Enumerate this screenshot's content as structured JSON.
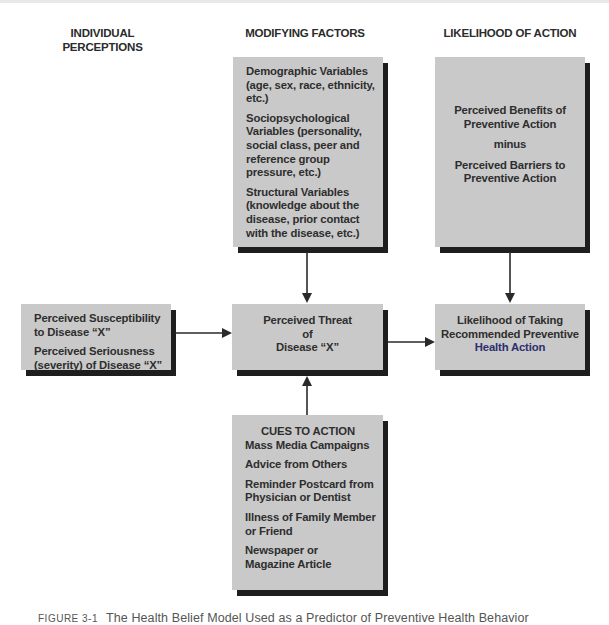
{
  "columns": {
    "individual": "INDIVIDUAL\nPERCEPTIONS",
    "individual_line1": "INDIVIDUAL",
    "individual_line2": "PERCEPTIONS",
    "modifying": "MODIFYING FACTORS",
    "likelihood": "LIKELIHOOD OF ACTION"
  },
  "boxes": {
    "modifying_factors": {
      "items": [
        {
          "title": "Demographic Variables",
          "detail": "(age, sex, race, ethnicity, etc.)"
        },
        {
          "title": "Sociopsychological Variables",
          "detail": "(personality, social class, peer and reference group pressure, etc.)"
        },
        {
          "title": "Structural Variables",
          "detail": "(knowledge about the disease, prior contact with the disease, etc.)"
        }
      ],
      "lines": [
        [
          "Demographic Variables",
          "(age, sex, race, ethnicity,",
          "etc.)"
        ],
        [
          "Sociopsychological",
          "Variables (personality,",
          "social class, peer and",
          "reference group",
          "pressure, etc.)"
        ],
        [
          "Structural Variables",
          "(knowledge about the",
          "disease, prior contact",
          "with the disease, etc.)"
        ]
      ]
    },
    "benefits_barriers": {
      "benefits": [
        "Perceived Benefits of",
        "Preventive Action"
      ],
      "operator": "minus",
      "barriers": [
        "Perceived Barriers to",
        "Preventive Action"
      ]
    },
    "individual_perceptions": {
      "susceptibility": [
        "Perceived Susceptibility",
        "to Disease “X”"
      ],
      "seriousness": [
        "Perceived Seriousness",
        "(severity) of Disease “X”"
      ]
    },
    "perceived_threat": {
      "lines": [
        "Perceived Threat",
        "of",
        "Disease “X”"
      ]
    },
    "likelihood_action": {
      "lines": [
        "Likelihood of Taking",
        "Recommended Preventive",
        "Health Action"
      ]
    },
    "cues_to_action": {
      "title": "CUES TO ACTION",
      "items": [
        [
          "Mass Media Campaigns"
        ],
        [
          "Advice from Others"
        ],
        [
          "Reminder Postcard from",
          "Physician or Dentist"
        ],
        [
          "Illness of Family Member",
          "or Friend"
        ],
        [
          "Newspaper or",
          "Magazine Article"
        ]
      ]
    }
  },
  "connections": [
    {
      "from": "Modifying Factors",
      "to": "Perceived Threat of Disease X",
      "direction": "down"
    },
    {
      "from": "Perceived Benefits minus Barriers",
      "to": "Likelihood of Taking Recommended Preventive Health Action",
      "direction": "down"
    },
    {
      "from": "Individual Perceptions",
      "to": "Perceived Threat of Disease X",
      "direction": "right"
    },
    {
      "from": "Perceived Threat of Disease X",
      "to": "Likelihood of Taking Recommended Preventive Health Action",
      "direction": "right"
    },
    {
      "from": "Cues to Action",
      "to": "Perceived Threat of Disease X",
      "direction": "up"
    }
  ],
  "caption": {
    "label": "FIGURE 3-1",
    "text": "The Health Belief Model Used as a Predictor of Preventive Health Behavior"
  },
  "colors": {
    "box_fill": "#c9c9c9",
    "box_shadow": "#1e1e1e",
    "text": "#2e2e2e",
    "arrow": "#2a2a2a"
  }
}
